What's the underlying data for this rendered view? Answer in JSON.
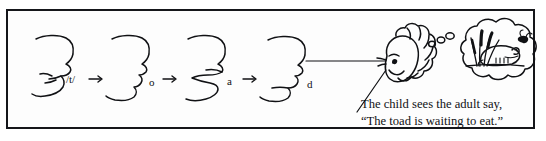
{
  "figure": {
    "border_color": "#15161a",
    "background_color": "#ffffff",
    "ink_color": "#101114"
  },
  "sequence": {
    "steps": [
      {
        "id": "step-1",
        "label": "/t/",
        "arrow": "→",
        "mouth": "tongue-tip-alveolar"
      },
      {
        "id": "step-2",
        "label": "o",
        "arrow": "→",
        "mouth": "rounded-open"
      },
      {
        "id": "step-3",
        "label": "a",
        "arrow": "→",
        "mouth": "wide-open"
      },
      {
        "id": "step-4",
        "label": "d",
        "arrow": "",
        "mouth": "closed-voiced"
      }
    ]
  },
  "scene": {
    "speaker": "adult-profile-face",
    "listener": "child-head-curly-hair",
    "gaze_line": "adult-to-child",
    "thought_bubble": {
      "tail_dots": 3,
      "contents": [
        "toad",
        "cattail-reeds",
        "fly",
        "pond-bank"
      ]
    }
  },
  "caption": {
    "line1": "The child sees the adult say,",
    "line2": "“The toad is waiting to eat.”"
  },
  "icons": {
    "arrow": "arrow-right-icon",
    "face": "face-profile-icon",
    "child": "child-head-icon",
    "bubble": "thought-bubble-icon",
    "toad": "toad-icon",
    "reeds": "cattail-reeds-icon",
    "fly": "fly-icon"
  }
}
